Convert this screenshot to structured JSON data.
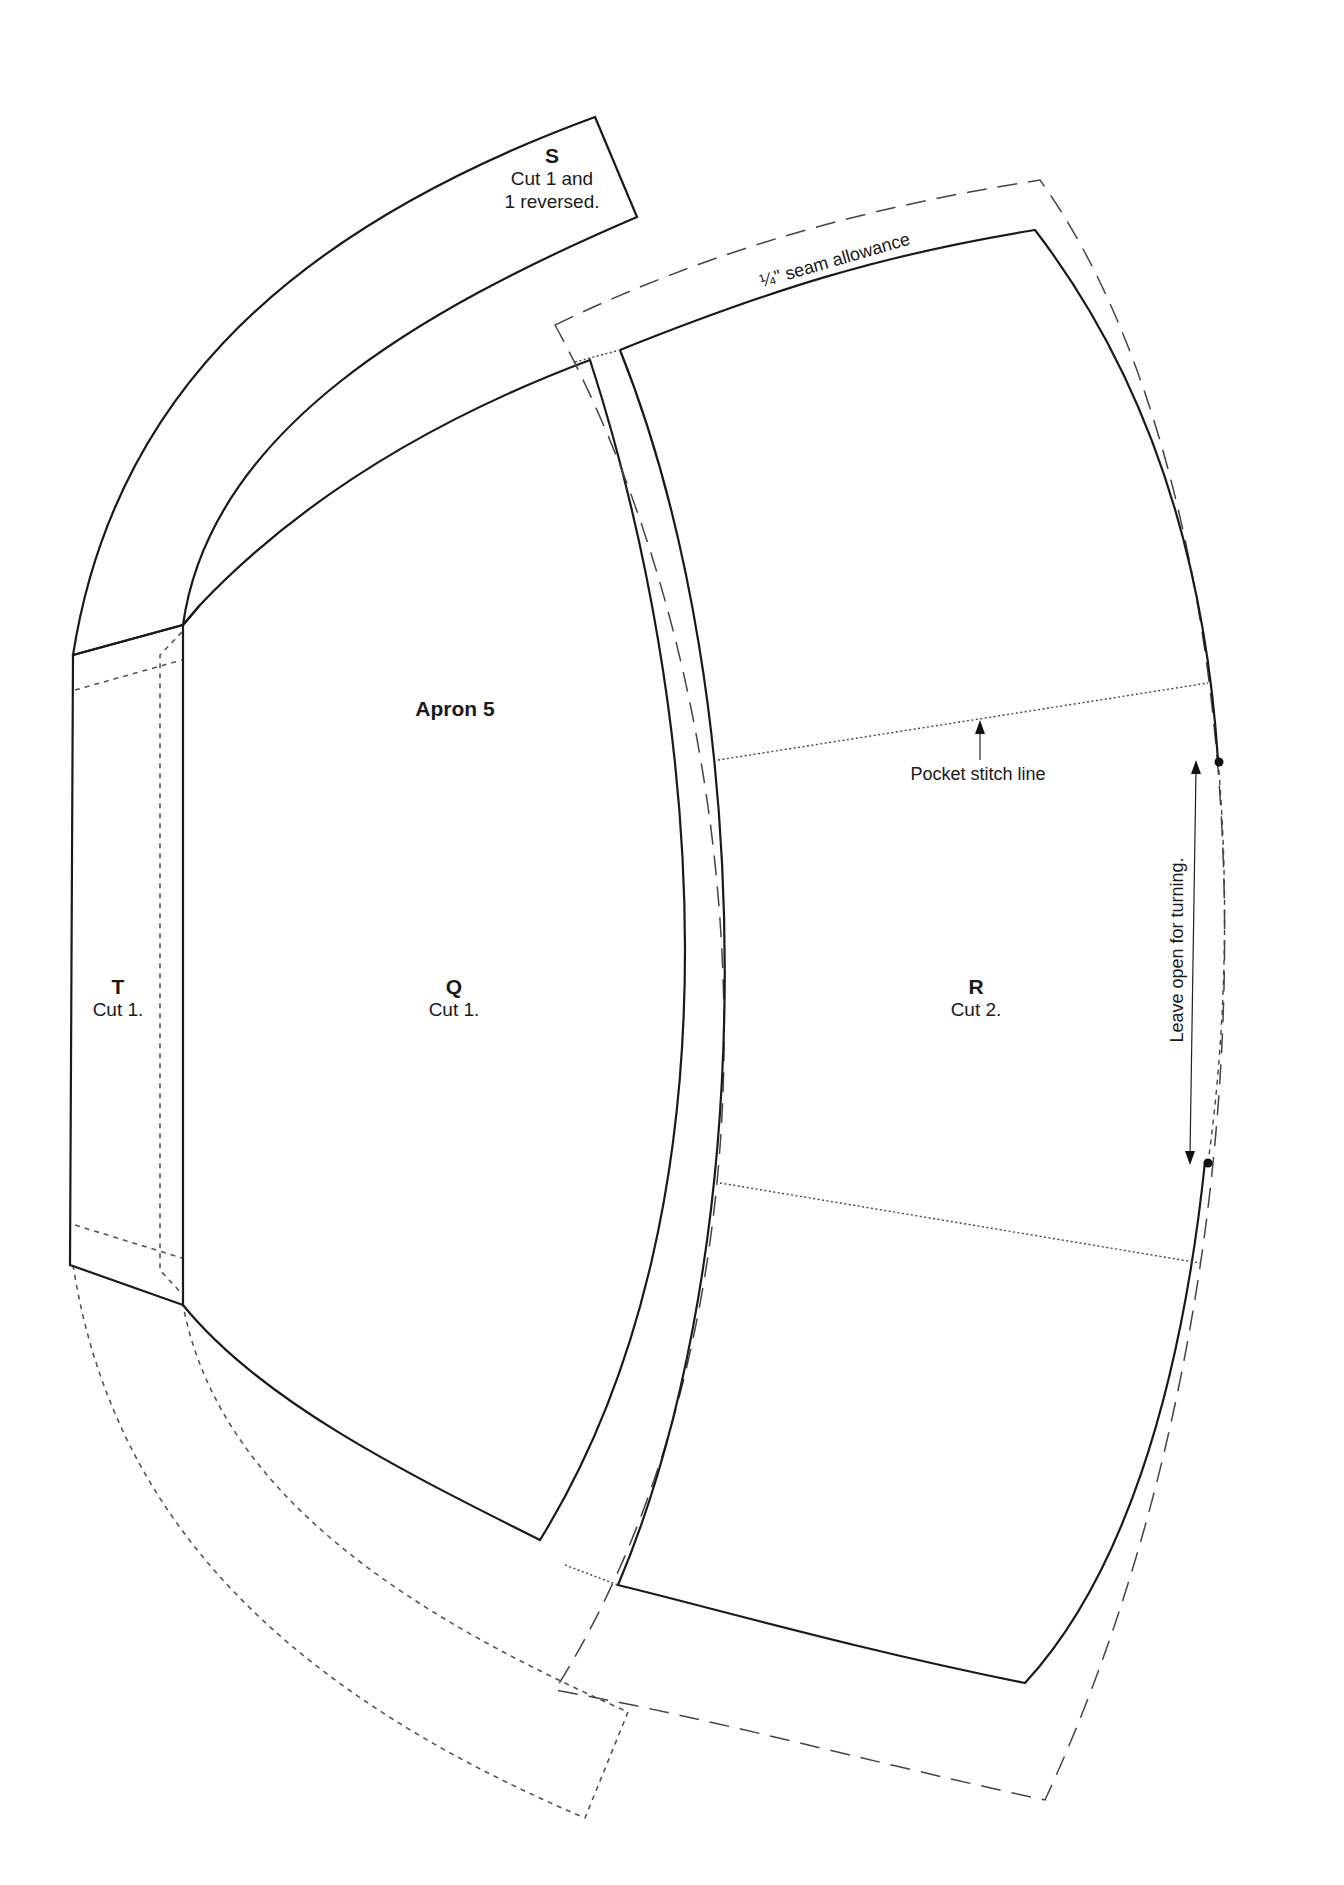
{
  "diagram": {
    "title": "Apron 5",
    "colors": {
      "line": "#1a1a1a",
      "dashed": "#444444",
      "background": "#ffffff"
    },
    "pieces": [
      {
        "id": "S",
        "letter": "S",
        "note_line1": "Cut 1 and",
        "note_line2": "1 reversed."
      },
      {
        "id": "T",
        "letter": "T",
        "note": "Cut 1."
      },
      {
        "id": "Q",
        "letter": "Q",
        "note": "Cut 1."
      },
      {
        "id": "R",
        "letter": "R",
        "note": "Cut 2."
      }
    ],
    "annotations": {
      "seam_allowance": "¼\" seam allowance",
      "pocket_stitch_line": "Pocket stitch line",
      "leave_open": "Leave open for turning."
    }
  }
}
